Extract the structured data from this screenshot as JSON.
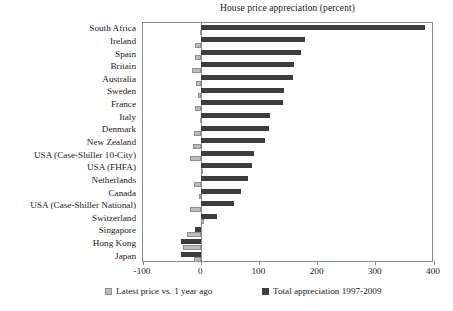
{
  "chart_data": {
    "type": "bar",
    "orientation": "horizontal",
    "title": "House price appreciation (percent)",
    "xlabel": "",
    "ylabel": "",
    "xlim": [
      -100,
      400
    ],
    "xticks": [
      -100,
      0,
      100,
      200,
      300,
      400
    ],
    "xtick_labels": [
      "-100",
      "0",
      "100",
      "200",
      "300",
      "400"
    ],
    "grid": false,
    "legend_position": "bottom",
    "categories": [
      "South Africa",
      "Ireland",
      "Spain",
      "Britain",
      "Australia",
      "Sweden",
      "France",
      "Italy",
      "Denmark",
      "New Zealand",
      "USA (Case-Shiller 10-City)",
      "USA (FHFA)",
      "Netherlands",
      "Canada",
      "USA (Case-Shiller National)",
      "Switzerland",
      "Singapore",
      "Hong Kong",
      "Japan"
    ],
    "series": [
      {
        "name": "Latest price vs. 1 year ago",
        "color": "#bcbcbc",
        "values": [
          -2,
          -10,
          -10,
          -16,
          -9,
          -5,
          -10,
          -2,
          -12,
          -14,
          -19,
          -1,
          -13,
          -4,
          -20,
          4,
          -25,
          -31,
          -12
        ]
      },
      {
        "name": "Total appreciation 1997-2009",
        "color": "#3d3d3d",
        "values": [
          385,
          178,
          172,
          159,
          158,
          143,
          141,
          118,
          117,
          110,
          91,
          87,
          80,
          68,
          56,
          28,
          -11,
          -35,
          -34
        ]
      }
    ]
  },
  "legend": {
    "items": [
      {
        "label": "Latest price vs. 1 year ago",
        "swatch": "light-gray-swatch"
      },
      {
        "label": "Total appreciation 1997-2009",
        "swatch": "dark-gray-swatch"
      }
    ]
  }
}
